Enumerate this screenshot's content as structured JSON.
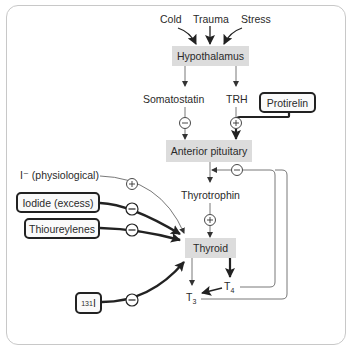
{
  "diagram": {
    "stimuli": [
      {
        "label": "Cold"
      },
      {
        "label": "Trauma"
      },
      {
        "label": "Stress"
      }
    ],
    "nodes": {
      "hypothalamus": "Hypothalamus",
      "somatostatin": "Somatostatin",
      "trh": "TRH",
      "anterior_pituitary": "Anterior pituitary",
      "thyrotrophin": "Thyrotrophin",
      "thyroid": "Thyroid",
      "t3": "T",
      "t3_sub": "3",
      "t4": "T",
      "t4_sub": "4",
      "iodide_physiological": "I⁻ (physiological)"
    },
    "drugs": {
      "protirelin": "Protirelin",
      "iodide_excess": "Iodide (excess)",
      "thioureylenes": "Thioureylenes",
      "radioiodine_sup": "131",
      "radioiodine": "I"
    },
    "signs": {
      "plus": "+",
      "minus": "−"
    },
    "edges": [
      {
        "from": "Cold",
        "to": "Hypothalamus",
        "effect": "stimulates"
      },
      {
        "from": "Trauma",
        "to": "Hypothalamus",
        "effect": "stimulates"
      },
      {
        "from": "Stress",
        "to": "Hypothalamus",
        "effect": "stimulates"
      },
      {
        "from": "Hypothalamus",
        "to": "Somatostatin"
      },
      {
        "from": "Hypothalamus",
        "to": "TRH"
      },
      {
        "from": "Somatostatin",
        "to": "Anterior pituitary",
        "sign": "-"
      },
      {
        "from": "TRH",
        "to": "Anterior pituitary",
        "sign": "+"
      },
      {
        "from": "Protirelin",
        "to": "Anterior pituitary",
        "sign": "+"
      },
      {
        "from": "Anterior pituitary",
        "to": "Thyrotrophin"
      },
      {
        "from": "Thyrotrophin",
        "to": "Thyroid",
        "sign": "+"
      },
      {
        "from": "I- (physiological)",
        "to": "Thyroid",
        "sign": "+"
      },
      {
        "from": "Iodide (excess)",
        "to": "Thyroid",
        "sign": "-"
      },
      {
        "from": "Thioureylenes",
        "to": "Thyroid",
        "sign": "-"
      },
      {
        "from": "131I",
        "to": "Thyroid",
        "sign": "-"
      },
      {
        "from": "Thyroid",
        "to": "T3"
      },
      {
        "from": "Thyroid",
        "to": "T4"
      },
      {
        "from": "T4",
        "to": "T3"
      },
      {
        "from": "T4",
        "to": "Anterior pituitary",
        "sign": "-"
      },
      {
        "from": "T3",
        "to": "Anterior pituitary",
        "sign": "-"
      }
    ],
    "colors": {
      "node_fill": "#dcdcdc",
      "line": "#222222",
      "thin_line": "#555555",
      "frame": "#c8c8c8"
    }
  }
}
